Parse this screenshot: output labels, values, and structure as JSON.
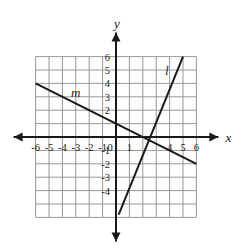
{
  "figure": {
    "kind": "coordinate-plane-graph",
    "background_color": "#ffffff",
    "grid_color": "#999999",
    "axis_color": "#1a1a1a",
    "line_color": "#1a1a1a",
    "text_color": "#1a1a1a"
  },
  "axes": {
    "x_label": "x",
    "y_label": "y",
    "origin_label": "0",
    "x_tick_labels": [
      "-6",
      "-5",
      "-4",
      "-3",
      "-2",
      "-1",
      "1",
      "4",
      "5",
      "6"
    ],
    "x_tick_values": [
      -6,
      -5,
      -4,
      -3,
      -2,
      -1,
      1,
      4,
      5,
      6
    ],
    "y_tick_labels": [
      "6",
      "5",
      "4",
      "3",
      "2",
      "-1",
      "-2",
      "-3",
      "-4"
    ],
    "y_tick_values": [
      6,
      5,
      4,
      3,
      2,
      -1,
      -2,
      -3,
      -4
    ],
    "x_range": [
      -6,
      6
    ],
    "y_range": [
      -6,
      6
    ],
    "grid": true,
    "grid_step": 1,
    "arrows": [
      "left",
      "right",
      "up",
      "down"
    ]
  },
  "lines": [
    {
      "label": "l",
      "label_position": {
        "x": 3.8,
        "y": 4.6
      },
      "equation": "y = 2x - 4",
      "slope": 2,
      "y_intercept": -4,
      "x_intercept": 2,
      "from": {
        "x": 0.2,
        "y": -5.8
      },
      "to": {
        "x": 5.0,
        "y": 6.0
      }
    },
    {
      "label": "m",
      "label_position": {
        "x": -3.0,
        "y": 3.0
      },
      "equation": "y = -0.5x + 1",
      "slope": -0.5,
      "y_intercept": 1,
      "x_intercept": 2,
      "from": {
        "x": -6.0,
        "y": 4.0
      },
      "to": {
        "x": 6.0,
        "y": -2.0
      }
    }
  ],
  "chart_data": {
    "type": "line",
    "title": "",
    "xlabel": "x",
    "ylabel": "y",
    "xlim": [
      -6,
      6
    ],
    "ylim": [
      -6,
      6
    ],
    "grid": true,
    "legend": "inline-labels",
    "series": [
      {
        "name": "l",
        "equation": "y = 2x - 4",
        "slope": 2,
        "intercept": -4,
        "x": [
          0,
          5
        ],
        "values": [
          -4,
          6
        ]
      },
      {
        "name": "m",
        "equation": "y = -0.5x + 1",
        "slope": -0.5,
        "intercept": 1,
        "x": [
          -6,
          6
        ],
        "values": [
          4,
          -2
        ]
      }
    ],
    "annotations": [
      {
        "text": "l",
        "x": 3.8,
        "y": 4.6
      },
      {
        "text": "m",
        "x": -3.0,
        "y": 3.0
      }
    ],
    "intersection": {
      "x": 2,
      "y": 0
    }
  }
}
